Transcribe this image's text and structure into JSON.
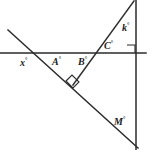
{
  "figure": {
    "background_color": "#ffffff",
    "line_color": "#2b2b2b",
    "label_color": "#1c1c1c",
    "width": 149,
    "height": 150,
    "degree_symbol": "°",
    "labels": {
      "x": "x",
      "A": "A",
      "B": "B",
      "C": "C",
      "k": "k",
      "M": "M"
    },
    "label_full": {
      "x": "x°",
      "A": "A°",
      "B": "B°",
      "C": "C°",
      "k": "k°",
      "M": "M°"
    },
    "lines": [
      {
        "name": "horizontal-line",
        "x1": 0,
        "y1": 53,
        "x2": 146,
        "y2": 53
      },
      {
        "name": "descending-diagonal-line",
        "x1": 8,
        "y1": 30,
        "x2": 138,
        "y2": 148
      },
      {
        "name": "ascending-diagonal-line",
        "x1": 73,
        "y1": 85,
        "x2": 134,
        "y2": 1
      },
      {
        "name": "vertical-line",
        "x1": 136,
        "y1": 0,
        "x2": 136,
        "y2": 150
      }
    ],
    "right_angles": [
      {
        "name": "right-angle-marker-lower",
        "points": "66,81 72,75 79,82 73,88"
      },
      {
        "name": "right-angle-marker-upper-right",
        "points": "127,45 136,45 136,53 127,53"
      }
    ]
  }
}
